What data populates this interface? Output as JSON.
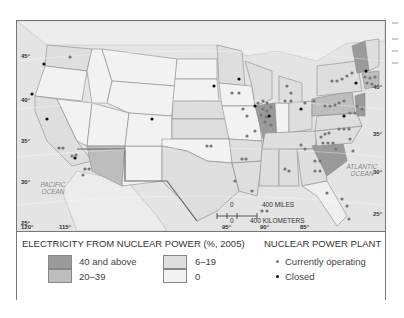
{
  "map": {
    "lat_ticks": [
      "45°",
      "40°",
      "35°",
      "30°",
      "25°"
    ],
    "lat_ticks_right": [
      "40°",
      "35°",
      "30°",
      "25°"
    ],
    "lon_ticks": [
      "120°",
      "115°",
      "95°",
      "90°",
      "85°"
    ],
    "oceans": {
      "pacific": "PACIFIC\nOCEAN",
      "atlantic": "ATLANTIC\nOCEAN"
    },
    "scale": {
      "miles_zero": "0",
      "miles": "400 MILES",
      "km_zero": "0",
      "km": "400 KILOMETERS"
    }
  },
  "legend": {
    "share_title": "ELECTRICITY FROM NUCLEAR POWER (%, 2005)",
    "categories": [
      {
        "label": "40 and above",
        "color": "#9a9a9a"
      },
      {
        "label": "20–39",
        "color": "#bdbdbd"
      },
      {
        "label": "6–19",
        "color": "#dedede"
      },
      {
        "label": "0",
        "color": "#f2f2f2"
      }
    ],
    "plant_title": "NUCLEAR POWER PLANT",
    "plants": [
      {
        "label": "Currently operating",
        "color": "#777777"
      },
      {
        "label": "Closed",
        "color": "#111111"
      }
    ]
  }
}
